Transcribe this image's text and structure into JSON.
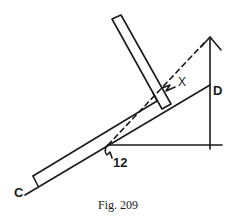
{
  "figure": {
    "caption": "Fig. 209",
    "labels": {
      "point_c": "C",
      "point_d": "D",
      "angle_x": "X",
      "angle_12": "12"
    }
  },
  "colors": {
    "ink": "#1a1a1a",
    "background": "#ffffff"
  }
}
